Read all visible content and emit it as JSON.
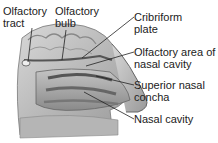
{
  "diagram": {
    "labels": [
      {
        "id": "olfactory-tract",
        "text": "Olfactory\ntract"
      },
      {
        "id": "olfactory-bulb",
        "text": "Olfactory\nbulb"
      },
      {
        "id": "cribriform-plate",
        "text": "Cribriform\nplate"
      },
      {
        "id": "olfactory-area",
        "text": "Olfactory area of\nnasal cavity"
      },
      {
        "id": "superior-nasal-concha",
        "text": "Superior nasal\nconcha"
      },
      {
        "id": "nasal-cavity",
        "text": "Nasal cavity"
      }
    ]
  }
}
